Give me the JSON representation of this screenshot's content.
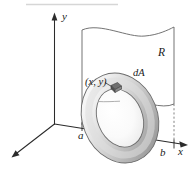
{
  "figure": {
    "kind": "math-diagram-3d",
    "axes": {
      "y_label": "y",
      "x_label": "x",
      "z_axis_label": ""
    },
    "labels": {
      "region": "R",
      "area_element": "dA",
      "point": "(x, y)",
      "lower_bound": "a",
      "upper_bound": "b"
    },
    "colors": {
      "stroke": "#2b2b2b",
      "region_edge": "#6b6b6b",
      "dashed": "#6e6e6e",
      "torus_light": "#f2f2f2",
      "torus_mid": "#c9c9c9",
      "torus_dark": "#8f8f8f",
      "top_rule": "#d6d6d6",
      "background": "#ffffff"
    }
  }
}
